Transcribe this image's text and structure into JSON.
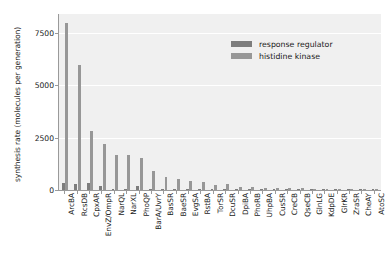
{
  "chart_data": {
    "type": "bar",
    "title": "",
    "xlabel": "",
    "ylabel": "synthesis rate (molecules per generation)",
    "ylim": [
      0,
      8400
    ],
    "yticks": [
      0,
      2500,
      5000,
      7500
    ],
    "ytick_labels": [
      "0",
      "2500",
      "5000",
      "7500"
    ],
    "grid": "horizontal",
    "legend_position": "upper right",
    "categories": [
      "ArcBA",
      "RcsDB",
      "CpxAR",
      "EnvZ/OmpR",
      "NarQL",
      "NarXL",
      "PhoQP",
      "BarA/UvrY",
      "BasSR",
      "BaeSR",
      "EvgSA",
      "RstBA",
      "TorSR",
      "DcuSR",
      "DpiBA",
      "PhoRB",
      "UhpBA",
      "CusSR",
      "CreCB",
      "QseCB",
      "GlnLG",
      "KdpDE",
      "GlrKR",
      "ZraSR",
      "CheAY",
      "AtoSC"
    ],
    "series": [
      {
        "name": "response regulator",
        "color": "#7d7d7d",
        "values": [
          330,
          300,
          320,
          210,
          60,
          55,
          190,
          60,
          50,
          45,
          40,
          38,
          30,
          28,
          25,
          22,
          20,
          18,
          16,
          15,
          14,
          12,
          10,
          8,
          6,
          5
        ]
      },
      {
        "name": "histidine kinase",
        "color": "#979797",
        "values": [
          7980,
          5980,
          2820,
          2200,
          1650,
          1660,
          1520,
          900,
          640,
          520,
          450,
          390,
          260,
          280,
          160,
          150,
          120,
          110,
          95,
          80,
          70,
          65,
          55,
          40,
          30,
          22
        ]
      }
    ]
  },
  "legend": {
    "items": [
      {
        "label": "response regulator",
        "color": "#7d7d7d"
      },
      {
        "label": "histidine kinase",
        "color": "#979797"
      }
    ]
  }
}
